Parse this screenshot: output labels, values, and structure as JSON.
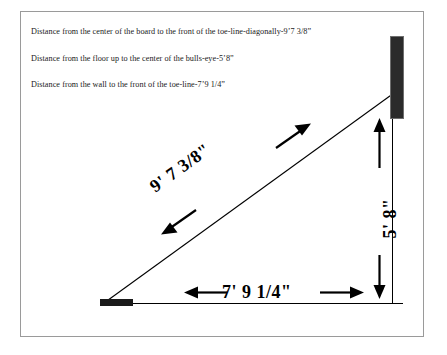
{
  "document": {
    "title": "Dartboard setup measurement diagram",
    "frame_border_color": "#9a9a9a",
    "background_color": "#ffffff",
    "ink_color": "#000000"
  },
  "captions": [
    {
      "id": "diagonal-note",
      "text": "Distance from the center of the board to the front of the toe-line-diagonally-9’7 3/8”"
    },
    {
      "id": "height-note",
      "text": "Distance from the floor up to the center of the bulls-eye-5’8”"
    },
    {
      "id": "floor-note",
      "text": "Distance from the wall to the front of the toe-line-7’9 1/4”"
    }
  ],
  "diagram": {
    "type": "right-triangle-measurement",
    "dimensions": {
      "diagonal": {
        "label": "9' 7 3/8\"",
        "name": "center-of-board-to-toe-line-diagonal"
      },
      "vertical": {
        "label": "5' 8\"",
        "name": "floor-to-bulls-eye-height"
      },
      "horizontal": {
        "label": "7' 9 1/4\"",
        "name": "wall-to-toe-line-distance"
      }
    },
    "elements": {
      "dartboard": "dartboard-block",
      "wall": "wall-line",
      "floor": "floor-line",
      "toe_line": "toe-line-marker",
      "hypotenuse": "throw-line-diagonal"
    },
    "geometry": {
      "apex_x": 104,
      "apex_y": 303,
      "wall_x": 392,
      "board_top_y": 36,
      "board_bottom_y": 118,
      "board_left_x": 391,
      "board_right_x": 404,
      "floor_y": 303,
      "floor_right_x": 403,
      "diagonal_end_x": 392,
      "diagonal_end_y": 95
    }
  }
}
